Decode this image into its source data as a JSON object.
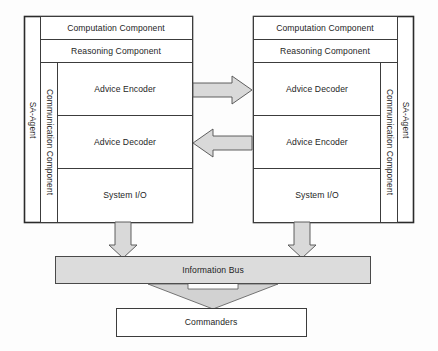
{
  "diagram": {
    "colors": {
      "stroke": "#3c3c3c",
      "arrow_fill": "#d9d9d9",
      "bus_fill": "#dcdcdc",
      "box_fill": "#ffffff",
      "text": "#1e1e1e"
    },
    "left_agent": {
      "outer_label": "SA-Agent",
      "side_label": "Communication Component",
      "rows": [
        {
          "label": "Computation Component"
        },
        {
          "label": "Reasoning Component"
        },
        {
          "label": "Advice Encoder"
        },
        {
          "label": "Advice Decoder"
        },
        {
          "label": "System I/O"
        }
      ]
    },
    "right_agent": {
      "outer_label": "SA-Agent",
      "side_label": "Communication Component",
      "rows": [
        {
          "label": "Computation Component"
        },
        {
          "label": "Reasoning Component"
        },
        {
          "label": "Advice Decoder"
        },
        {
          "label": "Advice Encoder"
        },
        {
          "label": "System I/O"
        }
      ]
    },
    "connectors": {
      "top_arrow_direction": "right",
      "bottom_arrow_direction": "left",
      "left_down_arrow": "down",
      "right_down_arrow": "down",
      "bus_to_commanders": "down"
    },
    "bus": {
      "label": "Information Bus"
    },
    "commanders": {
      "label": "Commanders"
    }
  }
}
